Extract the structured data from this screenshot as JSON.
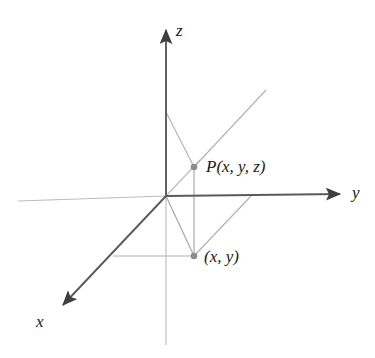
{
  "figure": {
    "kind": "3d-coordinate-axes-diagram",
    "background_color": "#ffffff",
    "width": 375,
    "height": 358,
    "colors": {
      "axis_dark": "#4a4a4a",
      "axis_light": "#b9b9b9",
      "helper_line": "#b0b0b0",
      "point_fill": "#8c8c8c",
      "text": "#1b1b1b"
    },
    "axes": [
      {
        "name": "z",
        "label": "z",
        "label_x": 176,
        "label_y": 22,
        "positive_from": [
          166,
          196
        ],
        "positive_to": [
          166,
          24
        ],
        "arrow": true,
        "negative_from": [
          166,
          196
        ],
        "negative_to": [
          166,
          345
        ]
      },
      {
        "name": "y",
        "label": "y",
        "label_x": 352,
        "label_y": 184,
        "positive_from": [
          166,
          196
        ],
        "positive_to": [
          347,
          194
        ],
        "arrow": true,
        "negative_from": [
          166,
          196
        ],
        "negative_to": [
          18,
          201
        ]
      },
      {
        "name": "x",
        "label": "x",
        "label_x": 36,
        "label_y": 313,
        "positive_from": [
          166,
          196
        ],
        "positive_to": [
          56,
          313
        ],
        "arrow": true,
        "negative_from": [
          166,
          196
        ],
        "negative_to": [
          198,
          162
        ]
      }
    ],
    "points": [
      {
        "id": "P",
        "label": "P(x, y, z)",
        "label_parts": [
          "P",
          "(",
          "x",
          ", ",
          "y",
          ", ",
          "z",
          ")"
        ],
        "cx": 194,
        "cy": 167,
        "r": 3.2,
        "label_x": 206,
        "label_y": 158
      },
      {
        "id": "xy",
        "label": "(x, y)",
        "label_parts": [
          "(",
          "x",
          ", ",
          "y",
          ")"
        ],
        "cx": 194,
        "cy": 256,
        "r": 3.2,
        "label_x": 204,
        "label_y": 248
      }
    ],
    "helper_lines": [
      {
        "name": "z-axis-to-P",
        "from": [
          166,
          112
        ],
        "to": [
          194,
          167
        ],
        "style": "thin-gray"
      },
      {
        "name": "P-upright-ray",
        "from": [
          194,
          167
        ],
        "to": [
          266,
          90
        ],
        "style": "thin-gray"
      },
      {
        "name": "P-to-xy-vertical",
        "from": [
          194,
          167
        ],
        "to": [
          194,
          256
        ],
        "style": "thin-gray"
      },
      {
        "name": "origin-to-xy",
        "from": [
          166,
          196
        ],
        "to": [
          194,
          256
        ],
        "style": "thin-gray"
      },
      {
        "name": "xy-to-y-axis",
        "from": [
          194,
          256
        ],
        "to": [
          251,
          196
        ],
        "style": "thin-gray"
      },
      {
        "name": "xy-to-x-axis",
        "from": [
          194,
          256
        ],
        "to": [
          113,
          256
        ],
        "style": "thin-gray"
      }
    ]
  }
}
